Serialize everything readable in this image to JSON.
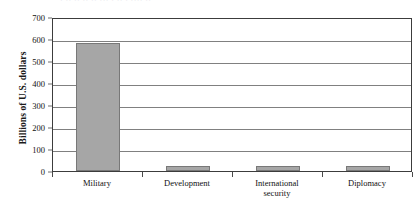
{
  "figure": {
    "title_remnant": "· ·· ··  ·· ·· ··· ·  ·· · ···· ··",
    "y_axis_title": "Billions of U.S. dollars"
  },
  "chart_data": {
    "type": "bar",
    "title": "",
    "subtitle": "",
    "xlabel": "",
    "ylabel": "Billions of U.S. dollars",
    "categories": [
      "Military",
      "Development",
      "International security",
      "Diplomacy"
    ],
    "category_lines": [
      [
        "Military"
      ],
      [
        "Development"
      ],
      [
        "International",
        "security"
      ],
      [
        "Diplomacy"
      ]
    ],
    "values": [
      580,
      22,
      22,
      22
    ],
    "ylim": [
      0,
      700
    ],
    "ytick_step": 100,
    "yticks": [
      0,
      100,
      200,
      300,
      400,
      500,
      600,
      700
    ],
    "ytick_labels": [
      "0",
      "100",
      "200",
      "300",
      "400",
      "500",
      "600",
      "700"
    ],
    "grid": true,
    "grid_axis": "y",
    "legend": false,
    "legend_position": "none",
    "bar_color": "#a6a6a6",
    "bar_border_color": "#787878",
    "gridline_color": "#808080",
    "frame_color": "#3c3c3c",
    "text_color": "#111111"
  }
}
